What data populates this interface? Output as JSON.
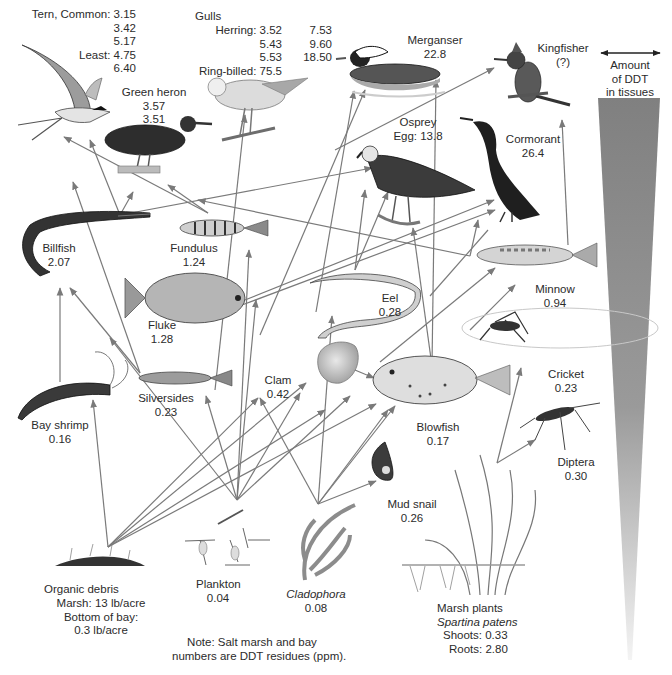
{
  "diagram": {
    "note_line1": "Note: Salt marsh and bay",
    "note_line2": "numbers are DDT residues (ppm).",
    "legend": {
      "line1": "Amount",
      "line2": "of DDT",
      "line3": "in tissues",
      "wedge_color_top": "#7f7f7f",
      "wedge_color_bottom": "#f2f2f2"
    },
    "arrow_color": "#7a7a7a"
  },
  "organisms": {
    "tern": {
      "name": "Tern, Common:",
      "v1": "3.15",
      "v2": "3.42",
      "v3": "5.17",
      "least_label": "Least:",
      "v4": "4.75",
      "v5": "6.40"
    },
    "gulls": {
      "name": "Gulls",
      "herring_label": "Herring:",
      "h1": "3.52",
      "h2": "5.43",
      "h3": "5.53",
      "h4": "7.53",
      "h5": "9.60",
      "h6": "18.50",
      "ringbilled_label": "Ring-billed:",
      "rb": "75.5"
    },
    "merganser": {
      "name": "Merganser",
      "value": "22.8"
    },
    "kingfisher": {
      "name": "Kingfisher",
      "value": "(?)"
    },
    "green_heron": {
      "name": "Green heron",
      "v1": "3.57",
      "v2": "3.51"
    },
    "osprey": {
      "name": "Osprey",
      "value": "Egg: 13.8"
    },
    "cormorant": {
      "name": "Cormorant",
      "value": "26.4"
    },
    "billfish": {
      "name": "Billfish",
      "value": "2.07"
    },
    "fundulus": {
      "name": "Fundulus",
      "value": "1.24"
    },
    "fluke": {
      "name": "Fluke",
      "value": "1.28"
    },
    "eel": {
      "name": "Eel",
      "value": "0.28"
    },
    "minnow": {
      "name": "Minnow",
      "value": "0.94"
    },
    "cricket": {
      "name": "Cricket",
      "value": "0.23"
    },
    "clam": {
      "name": "Clam",
      "value": "0.42"
    },
    "blowfish": {
      "name": "Blowfish",
      "value": "0.17"
    },
    "silversides": {
      "name": "Silversides",
      "value": "0.23"
    },
    "bay_shrimp": {
      "name": "Bay shrimp",
      "value": "0.16"
    },
    "diptera": {
      "name": "Diptera",
      "value": "0.30"
    },
    "mud_snail": {
      "name": "Mud snail",
      "value": "0.26"
    },
    "organic_debris": {
      "name": "Organic debris",
      "line1": "Marsh: 13 lb/acre",
      "line2": "Bottom of bay:",
      "line3": "0.3 lb/acre"
    },
    "plankton": {
      "name": "Plankton",
      "value": "0.04"
    },
    "cladophora": {
      "name": "Cladophora",
      "value": "0.08"
    },
    "marsh_plants": {
      "name": "Marsh plants",
      "species": "Spartina patens",
      "shoots": "Shoots: 0.33",
      "roots": "Roots: 2.80"
    }
  }
}
